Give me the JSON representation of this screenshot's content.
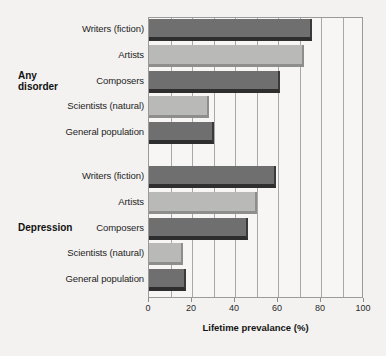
{
  "chart_data": {
    "type": "bar",
    "orientation": "horizontal",
    "title": "",
    "xlabel": "Lifetime prevalance (%)",
    "ylabel": "",
    "xlim": [
      0,
      100
    ],
    "xticks": [
      0,
      20,
      40,
      60,
      80,
      100
    ],
    "xtick_labels": [
      "0",
      "20",
      "40",
      "60",
      "80",
      "100"
    ],
    "gridlines": [
      10,
      20,
      30,
      40,
      50,
      60,
      70,
      80,
      90
    ],
    "grid": true,
    "legend": "none",
    "groups": [
      {
        "label": "Any disorder",
        "label_lines": [
          "Any",
          "disorder"
        ],
        "categories": [
          {
            "name": "Writers (fiction)",
            "value": 76,
            "color": "#6f6f6f",
            "shade": "dark"
          },
          {
            "name": "Artists",
            "value": 72,
            "color": "#b9b9b7",
            "shade": "light"
          },
          {
            "name": "Composers",
            "value": 61,
            "color": "#6f6f6f",
            "shade": "dark"
          },
          {
            "name": "Scientists (natural)",
            "value": 28,
            "color": "#b9b9b7",
            "shade": "light"
          },
          {
            "name": "General population",
            "value": 30,
            "color": "#6f6f6f",
            "shade": "dark"
          }
        ]
      },
      {
        "label": "Depression",
        "label_lines": [
          "Depression"
        ],
        "categories": [
          {
            "name": "Writers (fiction)",
            "value": 59,
            "color": "#6f6f6f",
            "shade": "dark"
          },
          {
            "name": "Artists",
            "value": 50,
            "color": "#b9b9b7",
            "shade": "light"
          },
          {
            "name": "Composers",
            "value": 46,
            "color": "#6f6f6f",
            "shade": "dark"
          },
          {
            "name": "Scientists (natural)",
            "value": 16,
            "color": "#b9b9b7",
            "shade": "light"
          },
          {
            "name": "General population",
            "value": 17,
            "color": "#6f6f6f",
            "shade": "dark"
          }
        ]
      }
    ],
    "colors": {
      "bar_dark": "#6f6f6f",
      "bar_light": "#b9b9b7",
      "bar_dark_shadow": "#2e2e2e",
      "bar_light_shadow": "#8e8e8c",
      "background": "#f3f2f0",
      "plot_background": "#f7f6f4",
      "axis": "#9a9a9a",
      "gridline": "#a8a8a8",
      "text": "#1b1b1b"
    }
  }
}
